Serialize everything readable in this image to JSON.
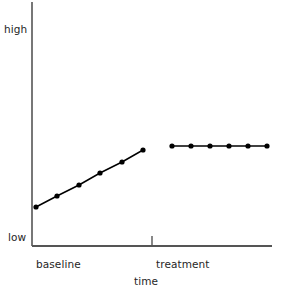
{
  "chart_data": {
    "type": "line",
    "title": "",
    "subtitle": "",
    "xlabel": "time",
    "ylabel": "",
    "y_tick_labels": [
      "high",
      "low"
    ],
    "ylim": [
      0,
      1
    ],
    "grid": false,
    "legend": "none",
    "annotations": [
      {
        "name": "phase-label-baseline",
        "text": "baseline",
        "x": 0.09,
        "y": -0.08
      },
      {
        "name": "phase-label-treatment",
        "text": "treatment",
        "x": 0.52,
        "y": -0.08
      },
      {
        "name": "phase-divider",
        "text": "",
        "x": 0.5,
        "y": 0
      }
    ],
    "series": [
      {
        "name": "baseline",
        "marker": "circle",
        "color": "#000000",
        "x": [
          0.02,
          0.1,
          0.19,
          0.27,
          0.36,
          0.45
        ],
        "values": [
          0.155,
          0.205,
          0.25,
          0.3,
          0.345,
          0.395
        ],
        "points_px": [
          {
            "x": 36,
            "y": 207
          },
          {
            "x": 57,
            "y": 196
          },
          {
            "x": 79,
            "y": 185
          },
          {
            "x": 100,
            "y": 173
          },
          {
            "x": 122,
            "y": 162
          },
          {
            "x": 143,
            "y": 150
          }
        ]
      },
      {
        "name": "treatment",
        "marker": "circle",
        "color": "#000000",
        "x": [
          0.58,
          0.66,
          0.74,
          0.82,
          0.9,
          0.98
        ],
        "values": [
          0.415,
          0.415,
          0.415,
          0.415,
          0.415,
          0.415
        ],
        "points_px": [
          {
            "x": 172,
            "y": 146
          },
          {
            "x": 191,
            "y": 146
          },
          {
            "x": 210,
            "y": 146
          },
          {
            "x": 229,
            "y": 146
          },
          {
            "x": 248,
            "y": 146
          },
          {
            "x": 267,
            "y": 146
          }
        ]
      }
    ],
    "axes_px": {
      "y_axis": {
        "x": 32,
        "y_top": 2,
        "y_bottom": 246
      },
      "x_axis": {
        "y": 246,
        "x_left": 32,
        "x_right": 272
      },
      "phase_tick": {
        "x": 152,
        "y_top": 236,
        "y_bottom": 246
      }
    },
    "colors": {
      "line": "#000000",
      "marker": "#000000",
      "axis": "#555555",
      "text": "#262626",
      "background": "#ffffff"
    }
  },
  "axis_labels": {
    "y_high": "high",
    "y_low": "low",
    "x_baseline": "baseline",
    "x_treatment": "treatment",
    "x_title": "time"
  }
}
